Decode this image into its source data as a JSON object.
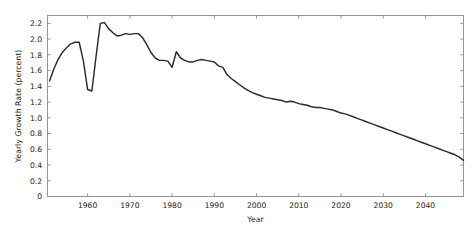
{
  "chart_data": {
    "type": "line",
    "title": "",
    "xlabel": "Year",
    "ylabel": "Yearly Growth Rate (percent)",
    "xlim": [
      1950.5,
      2049
    ],
    "ylim": [
      0,
      2.3
    ],
    "xticks": [
      1960,
      1970,
      1980,
      1990,
      2000,
      2010,
      2020,
      2030,
      2040
    ],
    "xtick_labels": [
      "1960",
      "1970",
      "1980",
      "1990",
      "2000",
      "2010",
      "2020",
      "2030",
      "2040"
    ],
    "yticks": [
      0,
      0.2,
      0.4,
      0.6,
      0.8,
      1.0,
      1.2,
      1.4,
      1.6,
      1.8,
      2.0,
      2.2
    ],
    "ytick_labels": [
      "0",
      "0.2",
      "0.4",
      "0.6",
      "0.8",
      "1.0",
      "1.2",
      "1.4",
      "1.6",
      "1.8",
      "2.0",
      "2.2"
    ],
    "grid": false,
    "legend": null,
    "line_color": "#2b2b2b",
    "axis_color": "#8c8c8c",
    "background_color": "#ffffff",
    "series": [
      {
        "name": "Yearly Growth Rate",
        "x": [
          1951,
          1952,
          1953,
          1954,
          1955,
          1956,
          1957,
          1958,
          1959,
          1960,
          1961,
          1962,
          1963,
          1964,
          1965,
          1966,
          1967,
          1968,
          1969,
          1970,
          1971,
          1972,
          1973,
          1974,
          1975,
          1976,
          1977,
          1978,
          1979,
          1980,
          1981,
          1982,
          1983,
          1984,
          1985,
          1986,
          1987,
          1988,
          1989,
          1990,
          1991,
          1992,
          1993,
          1994,
          1995,
          1996,
          1997,
          1998,
          1999,
          2000,
          2001,
          2002,
          2003,
          2004,
          2005,
          2006,
          2007,
          2008,
          2009,
          2010,
          2011,
          2012,
          2013,
          2014,
          2015,
          2016,
          2017,
          2018,
          2019,
          2020,
          2021,
          2022,
          2023,
          2024,
          2025,
          2026,
          2027,
          2028,
          2029,
          2030,
          2031,
          2032,
          2033,
          2034,
          2035,
          2036,
          2037,
          2038,
          2039,
          2040,
          2041,
          2042,
          2043,
          2044,
          2045,
          2046,
          2047,
          2048,
          2049
        ],
        "values": [
          1.47,
          1.62,
          1.74,
          1.83,
          1.89,
          1.94,
          1.96,
          1.96,
          1.72,
          1.36,
          1.34,
          1.78,
          2.2,
          2.21,
          2.13,
          2.08,
          2.04,
          2.05,
          2.07,
          2.06,
          2.07,
          2.07,
          2.02,
          1.93,
          1.83,
          1.76,
          1.73,
          1.73,
          1.72,
          1.64,
          1.84,
          1.76,
          1.73,
          1.71,
          1.71,
          1.73,
          1.74,
          1.73,
          1.72,
          1.71,
          1.66,
          1.64,
          1.55,
          1.5,
          1.46,
          1.42,
          1.38,
          1.35,
          1.32,
          1.3,
          1.28,
          1.26,
          1.25,
          1.24,
          1.23,
          1.22,
          1.2,
          1.21,
          1.2,
          1.18,
          1.17,
          1.16,
          1.14,
          1.13,
          1.13,
          1.12,
          1.11,
          1.1,
          1.08,
          1.06,
          1.05,
          1.03,
          1.01,
          0.99,
          0.97,
          0.95,
          0.93,
          0.91,
          0.89,
          0.87,
          0.85,
          0.83,
          0.81,
          0.79,
          0.77,
          0.75,
          0.73,
          0.71,
          0.69,
          0.67,
          0.65,
          0.63,
          0.61,
          0.59,
          0.57,
          0.55,
          0.53,
          0.5,
          0.46
        ]
      }
    ]
  }
}
